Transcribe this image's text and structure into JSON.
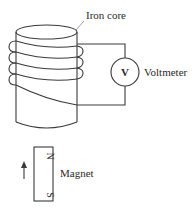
{
  "diagram": {
    "type": "electromagnetic-induction-setup",
    "labels": {
      "iron_core": "Iron core",
      "voltmeter": "Voltmeter",
      "voltmeter_symbol": "V",
      "magnet": "Magnet",
      "north_pole": "N",
      "south_pole": "S"
    },
    "components": [
      {
        "name": "iron-core",
        "shape": "cylinder"
      },
      {
        "name": "coil",
        "turns_visible": 4
      },
      {
        "name": "voltmeter",
        "shape": "circle"
      },
      {
        "name": "bar-magnet",
        "orientation": "vertical, N on top"
      },
      {
        "name": "motion-arrow",
        "direction": "up"
      }
    ],
    "colors": {
      "line": "#3a3a3a",
      "background": "#ffffff"
    }
  }
}
